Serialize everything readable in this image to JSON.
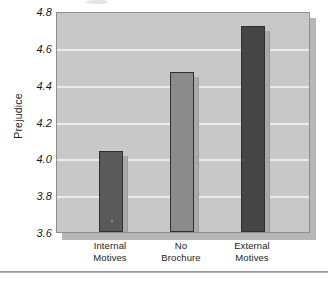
{
  "chart_data": {
    "type": "bar",
    "title": "",
    "subtitle": "",
    "xlabel": "",
    "ylabel": "Prejudice",
    "categories": [
      "Internal Motives",
      "No Brochure",
      "External Motives"
    ],
    "category_lines": [
      [
        "Internal",
        "Motives"
      ],
      [
        "No",
        "Brochure"
      ],
      [
        "External",
        "Motives"
      ]
    ],
    "values": [
      4.04,
      4.47,
      4.72
    ],
    "ylim": [
      3.6,
      4.8
    ],
    "ytick_step": 0.2,
    "ytick_labels": [
      "4.8",
      "4.6",
      "4.4",
      "4.2",
      "4.0",
      "3.8",
      "3.6"
    ],
    "ytick_values": [
      4.8,
      4.6,
      4.4,
      4.2,
      4.0,
      3.8,
      3.6
    ],
    "grid": true,
    "grid_orientation": "horizontal",
    "legend": false,
    "legend_position": "none",
    "bar_colors": [
      "#5a5a5a",
      "#8b8b8b",
      "#454545"
    ],
    "bar_side_color": "#a9a9a9",
    "plot_background": "#c8c8c8",
    "gridline_color": "#eceaea",
    "axis_color": "#8e8e8e",
    "text_color": "#1b1b1b"
  }
}
